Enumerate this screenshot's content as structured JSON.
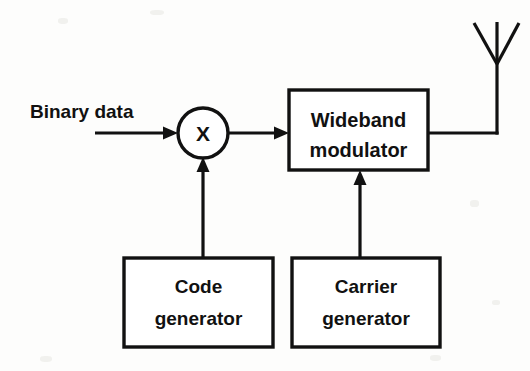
{
  "diagram": {
    "background_color": "#fdfdfc",
    "ink_color": "#111111",
    "inputs": [
      {
        "id": "binary-data",
        "label": "Binary data"
      }
    ],
    "nodes": [
      {
        "id": "multiplier",
        "type": "circle",
        "label": "X",
        "cx": 203,
        "cy": 133,
        "r": 25
      },
      {
        "id": "wideband-modulator",
        "type": "box",
        "label_line1": "Wideband",
        "label_line2": "modulator",
        "x": 289,
        "y": 90,
        "w": 139,
        "h": 80
      },
      {
        "id": "code-generator",
        "type": "box",
        "label_line1": "Code",
        "label_line2": "generator",
        "x": 124,
        "y": 258,
        "w": 149,
        "h": 89
      },
      {
        "id": "carrier-generator",
        "type": "box",
        "label_line1": "Carrier",
        "label_line2": "generator",
        "x": 292,
        "y": 258,
        "w": 148,
        "h": 89
      },
      {
        "id": "antenna",
        "type": "antenna",
        "label": "",
        "mast_x": 497,
        "mast_top": 63,
        "mast_bottom": 133
      }
    ],
    "connections": [
      {
        "id": "binary-data-to-multiplier",
        "from": "binary-data",
        "to": "multiplier",
        "arrow": true
      },
      {
        "id": "multiplier-to-modulator",
        "from": "multiplier",
        "to": "wideband-modulator",
        "arrow": true
      },
      {
        "id": "code-generator-to-multiplier",
        "from": "code-generator",
        "to": "multiplier",
        "arrow": true
      },
      {
        "id": "carrier-generator-to-modulator",
        "from": "carrier-generator",
        "to": "wideband-modulator",
        "arrow": true
      },
      {
        "id": "modulator-to-antenna",
        "from": "wideband-modulator",
        "to": "antenna",
        "arrow": false
      }
    ]
  }
}
